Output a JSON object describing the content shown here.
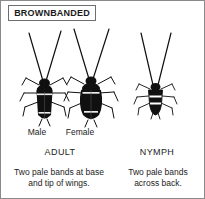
{
  "card": {
    "title": "BROWNBANDED",
    "species_common_name": "Brownbanded cockroach"
  },
  "figures": [
    {
      "id": "male",
      "label": "Male",
      "group": "ADULT",
      "description": "Dark slender adult cockroach with long antennae, wings covering a narrow tapered abdomen"
    },
    {
      "id": "female",
      "label": "Female",
      "group": "ADULT",
      "description": "Dark adult cockroach with long antennae and a broad rounded abdomen, short wings"
    },
    {
      "id": "nymph",
      "label": "",
      "group": "NYMPH",
      "description": "Small wingless immature cockroach with long antennae and two pale bands across the back"
    }
  ],
  "stage_labels": {
    "adult": "ADULT",
    "nymph": "NYMPH"
  },
  "captions": {
    "adult": "Two pale bands at base and tip of wings.",
    "nymph": "Two pale bands across back."
  },
  "colors": {
    "body": "#101010",
    "band": "#ffffff",
    "outline": "#6e6e6e",
    "text": "#1c1c1c",
    "background": "#ffffff"
  }
}
